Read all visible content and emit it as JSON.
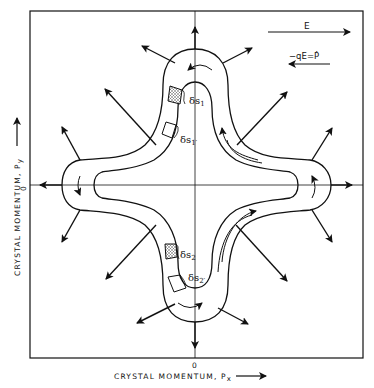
{
  "figure": {
    "x_axis": {
      "label": "CRYSTAL MOMENTUM, P",
      "subscript": "x",
      "origin_label": "0"
    },
    "y_axis": {
      "label": "CRYSTAL MOMENTUM, P",
      "subscript": "y",
      "origin_label": "0"
    },
    "legend": {
      "field_label": "E",
      "force_label": "−qE=Ṗ"
    },
    "annotations": {
      "ds1": "δs",
      "ds1_sub": "1",
      "ds1p": "δs",
      "ds1p_sub": "1′",
      "ds2": "δs",
      "ds2_sub": "2",
      "ds2p": "δs",
      "ds2p_sub": "2′"
    },
    "colors": {
      "ink": "#111111",
      "stipple": "#9a9a9a",
      "background": "#ffffff"
    }
  }
}
